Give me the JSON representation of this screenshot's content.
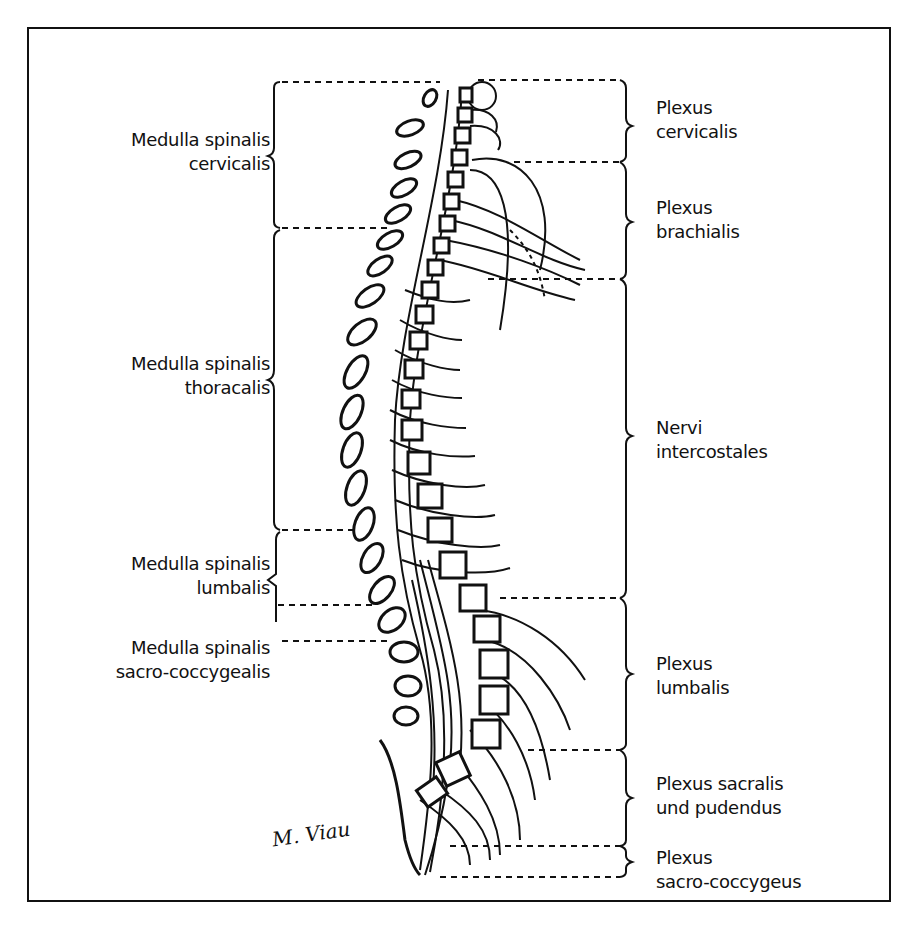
{
  "figure": {
    "left_labels": [
      {
        "id": "cervicalis",
        "line1": "Medulla spinalis",
        "line2": "cervicalis"
      },
      {
        "id": "thoracalis",
        "line1": "Medulla spinalis",
        "line2": "thoracalis"
      },
      {
        "id": "lumbalis",
        "line1": "Medulla spinalis",
        "line2": "lumbalis"
      },
      {
        "id": "sacro-coccygealis",
        "line1": "Medulla spinalis",
        "line2": "sacro-coccygealis"
      }
    ],
    "right_labels": [
      {
        "id": "plexus-cervicalis",
        "line1": "Plexus",
        "line2": "cervicalis"
      },
      {
        "id": "plexus-brachialis",
        "line1": "Plexus",
        "line2": "brachialis"
      },
      {
        "id": "nervi-intercostales",
        "line1": "Nervi",
        "line2": "intercostales"
      },
      {
        "id": "plexus-lumbalis",
        "line1": "Plexus",
        "line2": "lumbalis"
      },
      {
        "id": "plexus-sacralis",
        "line1": "Plexus sacralis",
        "line2": "und pudendus"
      },
      {
        "id": "plexus-sacro-coccygeus",
        "line1": "Plexus",
        "line2": "sacro-coccygeus"
      }
    ],
    "signature": "M. Viau",
    "colors": {
      "ink": "#111111",
      "background": "#ffffff"
    }
  }
}
